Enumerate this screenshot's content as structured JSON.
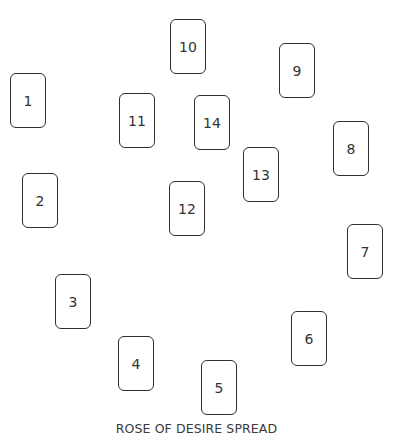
{
  "spread": {
    "title": "ROSE OF DESIRE SPREAD",
    "cards": [
      {
        "label": "1"
      },
      {
        "label": "2"
      },
      {
        "label": "3"
      },
      {
        "label": "4"
      },
      {
        "label": "5"
      },
      {
        "label": "6"
      },
      {
        "label": "7"
      },
      {
        "label": "8"
      },
      {
        "label": "9"
      },
      {
        "label": "10"
      },
      {
        "label": "11"
      },
      {
        "label": "12"
      },
      {
        "label": "13"
      },
      {
        "label": "14"
      }
    ]
  }
}
